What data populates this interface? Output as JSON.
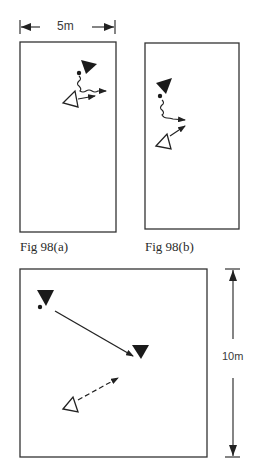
{
  "figure": {
    "scale_top": {
      "label": "5m"
    },
    "scale_right": {
      "label": "10m"
    },
    "panels": [
      {
        "id": "fig98a",
        "caption": "Fig 98(a)"
      },
      {
        "id": "fig98b",
        "caption": "Fig 98(b)"
      },
      {
        "id": "fig98c",
        "caption": ""
      }
    ],
    "legend_semantics": {
      "filled_triangle": "attacker (dark)",
      "open_triangle": "defender (light)",
      "dot": "ball",
      "wavy_line": "dribble",
      "solid_arrow": "pass/run",
      "dashed_arrow": "run without ball"
    },
    "colors": {
      "ink": "#2a2a2a",
      "paper": "#ffffff"
    }
  }
}
